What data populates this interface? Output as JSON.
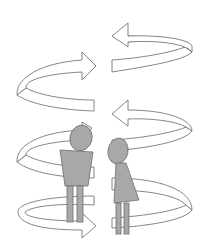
{
  "colors": {
    "background": "#ffffff",
    "arrow_stroke": "#777777",
    "arrow_fill": "#ffffff",
    "figure_fill": "#a8a8a8",
    "figure_stroke": "#6e6e6e"
  },
  "arrows": [
    {
      "id": "arrow-1",
      "direction": "left",
      "position": "top-right"
    },
    {
      "id": "arrow-2",
      "direction": "right",
      "position": "upper-left"
    },
    {
      "id": "arrow-3",
      "direction": "left",
      "position": "middle-right"
    },
    {
      "id": "arrow-4",
      "direction": "right",
      "position": "middle-left"
    },
    {
      "id": "arrow-5",
      "direction": "right",
      "position": "bottom-left"
    },
    {
      "id": "arrow-6",
      "direction": "left",
      "position": "bottom-right"
    }
  ],
  "figures": [
    {
      "id": "male-figure",
      "shape": "trapezoid-body"
    },
    {
      "id": "female-figure",
      "shape": "triangle-dress"
    }
  ]
}
